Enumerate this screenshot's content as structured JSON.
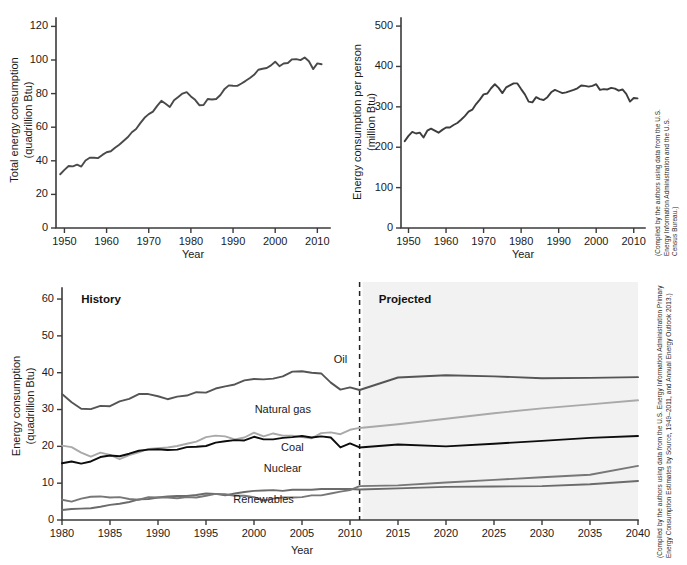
{
  "figure": {
    "background_color": "#ffffff",
    "projected_shade_color": "#f2f2f2"
  },
  "panels": {
    "top_left": {
      "name": "total-energy-consumption",
      "credit": "(Compiled by the authors using data from the U.S. Energy Information Administration and the U.S. Census Bureau.)"
    },
    "top_right": {
      "name": "energy-consumption-per-person",
      "credit": "(Compiled by the authors using data from the U.S. Energy Information Administration and the U.S. Census Bureau.)"
    },
    "bottom": {
      "name": "energy-consumption-by-source",
      "history_label": "History",
      "projected_label": "Projected",
      "divider_year": 2011,
      "credit": "(Compiled by the authors using data from the U.S. Energy Information Administration Primary Energy Consumption Estimates by Source, 1949–2011, and Annual Energy Outlook 2013.)"
    }
  },
  "chart_data": [
    {
      "id": "total-energy-consumption",
      "type": "line",
      "title": "",
      "xlabel": "Year",
      "ylabel": "Total energy consumption\n(quadrillion Btu)",
      "ylabel_line1": "Total energy consumption",
      "ylabel_line2": "(quadrillion Btu)",
      "xlim": [
        1948,
        2013
      ],
      "ylim": [
        0,
        125
      ],
      "xticks": [
        1950,
        1960,
        1970,
        1980,
        1990,
        2000,
        2010
      ],
      "yticks": [
        0,
        20,
        40,
        60,
        80,
        100,
        120
      ],
      "grid": false,
      "legend": "none",
      "line_color": "#4a4a4a",
      "x": [
        1949,
        1950,
        1951,
        1952,
        1953,
        1954,
        1955,
        1956,
        1957,
        1958,
        1959,
        1960,
        1961,
        1962,
        1963,
        1964,
        1965,
        1966,
        1967,
        1968,
        1969,
        1970,
        1971,
        1972,
        1973,
        1974,
        1975,
        1976,
        1977,
        1978,
        1979,
        1980,
        1981,
        1982,
        1983,
        1984,
        1985,
        1986,
        1987,
        1988,
        1989,
        1990,
        1991,
        1992,
        1993,
        1994,
        1995,
        1996,
        1997,
        1998,
        1999,
        2000,
        2001,
        2002,
        2003,
        2004,
        2005,
        2006,
        2007,
        2008,
        2009,
        2010,
        2011
      ],
      "y": [
        32.0,
        34.6,
        36.9,
        36.7,
        37.7,
        36.6,
        40.2,
        41.8,
        41.8,
        41.6,
        43.5,
        45.1,
        45.7,
        47.8,
        49.6,
        51.8,
        54.0,
        57.0,
        58.9,
        62.4,
        65.6,
        67.8,
        69.3,
        72.7,
        75.7,
        73.9,
        72.0,
        76.0,
        78.0,
        80.0,
        80.9,
        78.3,
        76.3,
        73.1,
        73.2,
        76.8,
        76.5,
        76.8,
        79.2,
        82.8,
        84.9,
        84.7,
        84.6,
        86.0,
        87.6,
        89.3,
        91.2,
        94.2,
        94.8,
        95.2,
        96.8,
        99.0,
        96.3,
        97.9,
        98.2,
        100.4,
        100.5,
        99.9,
        101.5,
        99.3,
        94.6,
        98.0,
        97.5
      ]
    },
    {
      "id": "energy-consumption-per-person",
      "type": "line",
      "title": "",
      "xlabel": "Year",
      "ylabel": "Energy consumption per person\n(million Btu)",
      "ylabel_line1": "Energy consumption per person",
      "ylabel_line2": "(million Btu)",
      "xlim": [
        1948,
        2013
      ],
      "ylim": [
        0,
        520
      ],
      "xticks": [
        1950,
        1960,
        1970,
        1980,
        1990,
        2000,
        2010
      ],
      "yticks": [
        0,
        100,
        200,
        300,
        400,
        500
      ],
      "grid": false,
      "legend": "none",
      "line_color": "#3d3d3d",
      "x": [
        1949,
        1950,
        1951,
        1952,
        1953,
        1954,
        1955,
        1956,
        1957,
        1958,
        1959,
        1960,
        1961,
        1962,
        1963,
        1964,
        1965,
        1966,
        1967,
        1968,
        1969,
        1970,
        1971,
        1972,
        1973,
        1974,
        1975,
        1976,
        1977,
        1978,
        1979,
        1980,
        1981,
        1982,
        1983,
        1984,
        1985,
        1986,
        1987,
        1988,
        1989,
        1990,
        1991,
        1992,
        1993,
        1994,
        1995,
        1996,
        1997,
        1998,
        1999,
        2000,
        2001,
        2002,
        2003,
        2004,
        2005,
        2006,
        2007,
        2008,
        2009,
        2010,
        2011
      ],
      "y": [
        215,
        228,
        238,
        234,
        236,
        224,
        241,
        246,
        241,
        236,
        243,
        249,
        249,
        255,
        260,
        268,
        277,
        288,
        293,
        307,
        318,
        331,
        333,
        346,
        356,
        347,
        334,
        348,
        353,
        358,
        358,
        344,
        331,
        313,
        311,
        324,
        319,
        317,
        324,
        336,
        342,
        338,
        334,
        336,
        339,
        342,
        346,
        353,
        352,
        350,
        352,
        356,
        342,
        344,
        343,
        347,
        345,
        340,
        343,
        332,
        313,
        322,
        321
      ]
    },
    {
      "id": "energy-consumption-by-source",
      "type": "line",
      "xlabel": "Year",
      "ylabel": "Energy consumption\n(quadrillion Btu)",
      "ylabel_line1": "Energy consumption",
      "ylabel_line2": "(quadrillion Btu)",
      "xlim": [
        1980,
        2040
      ],
      "ylim": [
        0,
        63
      ],
      "xticks": [
        1980,
        1985,
        1990,
        1995,
        2000,
        2005,
        2010,
        2015,
        2020,
        2025,
        2030,
        2035,
        2040
      ],
      "yticks": [
        0,
        10,
        20,
        30,
        40,
        50,
        60
      ],
      "grid": false,
      "legend": "inline-labels",
      "divider_year": 2011,
      "annotations": [
        {
          "text": "History",
          "x": 1982,
          "y": 59
        },
        {
          "text": "Projected",
          "x": 2013,
          "y": 59
        }
      ],
      "series": [
        {
          "name": "Oil",
          "color": "#555555",
          "width": 1.9,
          "label_x": 2009,
          "label_y": 42.5,
          "x": [
            1980,
            1981,
            1982,
            1983,
            1984,
            1985,
            1986,
            1987,
            1988,
            1989,
            1990,
            1991,
            1992,
            1993,
            1994,
            1995,
            1996,
            1997,
            1998,
            1999,
            2000,
            2001,
            2002,
            2003,
            2004,
            2005,
            2006,
            2007,
            2008,
            2009,
            2010,
            2011,
            2015,
            2020,
            2025,
            2030,
            2035,
            2040
          ],
          "y": [
            34.2,
            32.0,
            30.2,
            30.1,
            31.0,
            30.9,
            32.2,
            32.9,
            34.2,
            34.2,
            33.6,
            32.8,
            33.5,
            33.8,
            34.7,
            34.6,
            35.7,
            36.3,
            36.8,
            37.9,
            38.3,
            38.2,
            38.4,
            39.0,
            40.3,
            40.4,
            40.0,
            39.8,
            37.3,
            35.4,
            36.0,
            35.3,
            38.7,
            39.3,
            39.0,
            38.5,
            38.6,
            38.8
          ]
        },
        {
          "name": "Natural gas",
          "color": "#a9a9a9",
          "width": 1.9,
          "label_x": 2003,
          "label_y": 29.0,
          "x": [
            1980,
            1981,
            1982,
            1983,
            1984,
            1985,
            1986,
            1987,
            1988,
            1989,
            1990,
            1991,
            1992,
            1993,
            1994,
            1995,
            1996,
            1997,
            1998,
            1999,
            2000,
            2001,
            2002,
            2003,
            2004,
            2005,
            2006,
            2007,
            2008,
            2009,
            2010,
            2011,
            2015,
            2020,
            2025,
            2030,
            2035,
            2040
          ],
          "y": [
            20.2,
            19.8,
            18.3,
            17.2,
            18.3,
            17.7,
            16.5,
            17.6,
            18.4,
            19.3,
            19.5,
            19.7,
            20.1,
            20.7,
            21.3,
            22.5,
            22.9,
            22.7,
            21.9,
            22.4,
            23.7,
            22.7,
            23.5,
            22.9,
            22.9,
            22.5,
            22.2,
            23.6,
            23.8,
            23.3,
            24.5,
            25.0,
            26.0,
            27.5,
            29.0,
            30.3,
            31.4,
            32.5
          ]
        },
        {
          "name": "Coal",
          "color": "#0d0d0d",
          "width": 2.3,
          "label_x": 2004,
          "label_y": 18.7,
          "x": [
            1980,
            1981,
            1982,
            1983,
            1984,
            1985,
            1986,
            1987,
            1988,
            1989,
            1990,
            1991,
            1992,
            1993,
            1994,
            1995,
            1996,
            1997,
            1998,
            1999,
            2000,
            2001,
            2002,
            2003,
            2004,
            2005,
            2006,
            2007,
            2008,
            2009,
            2010,
            2011,
            2015,
            2020,
            2025,
            2030,
            2035,
            2040
          ],
          "y": [
            15.4,
            15.9,
            15.3,
            15.9,
            17.1,
            17.5,
            17.3,
            18.0,
            18.8,
            19.1,
            19.2,
            19.0,
            19.1,
            19.8,
            19.9,
            20.1,
            21.0,
            21.4,
            21.7,
            21.6,
            22.6,
            21.9,
            21.9,
            22.3,
            22.5,
            22.8,
            22.4,
            22.7,
            22.4,
            19.7,
            20.8,
            19.7,
            20.5,
            20.0,
            20.7,
            21.5,
            22.3,
            22.8
          ]
        },
        {
          "name": "Nuclear",
          "color": "#6b6b6b",
          "width": 1.9,
          "label_x": 2003,
          "label_y": 13.0,
          "x": [
            1980,
            1981,
            1982,
            1983,
            1984,
            1985,
            1986,
            1987,
            1988,
            1989,
            1990,
            1991,
            1992,
            1993,
            1994,
            1995,
            1996,
            1997,
            1998,
            1999,
            2000,
            2001,
            2002,
            2003,
            2004,
            2005,
            2006,
            2007,
            2008,
            2009,
            2010,
            2011,
            2015,
            2020,
            2025,
            2030,
            2035,
            2040
          ],
          "y": [
            2.7,
            3.0,
            3.1,
            3.2,
            3.6,
            4.1,
            4.4,
            4.9,
            5.6,
            5.7,
            6.1,
            6.4,
            6.5,
            6.5,
            6.8,
            7.2,
            7.1,
            6.7,
            7.2,
            7.6,
            7.9,
            8.0,
            8.1,
            7.9,
            8.2,
            8.2,
            8.2,
            8.4,
            8.4,
            8.4,
            8.4,
            8.3,
            8.6,
            9.0,
            9.1,
            9.2,
            9.7,
            10.6
          ]
        },
        {
          "name": "Renewables",
          "color": "#777777",
          "width": 1.9,
          "label_x": 2001,
          "label_y": 4.6,
          "x": [
            1980,
            1981,
            1982,
            1983,
            1984,
            1985,
            1986,
            1987,
            1988,
            1989,
            1990,
            1991,
            1992,
            1993,
            1994,
            1995,
            1996,
            1997,
            1998,
            1999,
            2000,
            2001,
            2002,
            2003,
            2004,
            2005,
            2006,
            2007,
            2008,
            2009,
            2010,
            2011,
            2015,
            2020,
            2025,
            2030,
            2035,
            2040
          ],
          "y": [
            5.5,
            5.0,
            5.8,
            6.3,
            6.4,
            6.1,
            6.2,
            5.7,
            5.5,
            6.2,
            6.1,
            6.1,
            5.9,
            6.2,
            6.1,
            6.6,
            7.1,
            7.0,
            6.6,
            6.6,
            6.2,
            5.3,
            5.8,
            6.1,
            6.1,
            6.2,
            6.7,
            6.7,
            7.2,
            7.7,
            8.1,
            9.2,
            9.4,
            10.2,
            10.9,
            11.6,
            12.3,
            14.7
          ]
        }
      ]
    }
  ]
}
